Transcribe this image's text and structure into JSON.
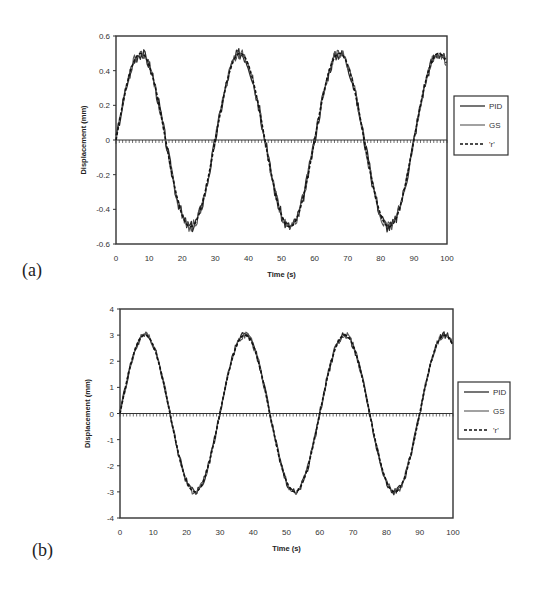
{
  "chart_data": [
    {
      "panel_label": "(a)",
      "type": "line",
      "title": "",
      "xlabel": "Time (s)",
      "ylabel": "Displacement (mm)",
      "xlim": [
        0,
        100
      ],
      "ylim": [
        -0.6,
        0.6
      ],
      "xticks": [
        0,
        10,
        20,
        30,
        40,
        50,
        60,
        70,
        80,
        90,
        100
      ],
      "yticks": [
        0.6,
        0.4,
        0.2,
        0,
        -0.2,
        -0.4,
        -0.6
      ],
      "ytick_labels": [
        "0.6",
        "0.4",
        "0.2",
        "0",
        "-0.2",
        "-0.4",
        "-0.6"
      ],
      "grid": false,
      "legend_position": "right",
      "signal": {
        "form": "sine",
        "amplitude": 0.5,
        "period_s": 30,
        "offset": 0
      },
      "series": [
        {
          "name": "PID",
          "style": "solid",
          "noise": 0.035,
          "x": [
            0,
            7.5,
            15,
            22.5,
            30,
            37.5,
            45,
            52.5,
            60,
            67.5,
            75,
            82.5,
            90,
            97.5,
            100
          ],
          "values": [
            0,
            0.52,
            0,
            -0.5,
            0,
            0.53,
            0,
            -0.52,
            0,
            0.52,
            0,
            -0.52,
            0,
            0.53,
            0.44
          ]
        },
        {
          "name": "GS",
          "style": "solid",
          "noise": 0.03,
          "x": [
            0,
            7.5,
            15,
            22.5,
            30,
            37.5,
            45,
            52.5,
            60,
            67.5,
            75,
            82.5,
            90,
            97.5,
            100
          ],
          "values": [
            0,
            0.5,
            0,
            -0.5,
            0,
            0.5,
            0,
            -0.5,
            0,
            0.5,
            0,
            -0.5,
            0,
            0.5,
            0.43
          ]
        },
        {
          "name": "'r'",
          "style": "dashed",
          "noise": 0,
          "x": [
            0,
            7.5,
            15,
            22.5,
            30,
            37.5,
            45,
            52.5,
            60,
            67.5,
            75,
            82.5,
            90,
            97.5,
            100
          ],
          "values": [
            0,
            0.5,
            0,
            -0.5,
            0,
            0.5,
            0,
            -0.5,
            0,
            0.5,
            0,
            -0.5,
            0,
            0.5,
            0.43
          ]
        }
      ]
    },
    {
      "panel_label": "(b)",
      "type": "line",
      "title": "",
      "xlabel": "Time (s)",
      "ylabel": "Displacement (mm)",
      "xlim": [
        0,
        100
      ],
      "ylim": [
        -4,
        4
      ],
      "xticks": [
        0,
        10,
        20,
        30,
        40,
        50,
        60,
        70,
        80,
        90,
        100
      ],
      "yticks": [
        4,
        3,
        2,
        1,
        0,
        -1,
        -2,
        -3,
        -4
      ],
      "ytick_labels": [
        "4",
        "3",
        "2",
        "1",
        "0",
        "-1",
        "-2",
        "-3",
        "-4"
      ],
      "grid": false,
      "legend_position": "right",
      "signal": {
        "form": "sine",
        "amplitude": 3,
        "period_s": 30,
        "offset": 0
      },
      "series": [
        {
          "name": "PID",
          "style": "solid",
          "noise": 0.02,
          "x": [
            0,
            7.5,
            15,
            22.5,
            30,
            37.5,
            45,
            52.5,
            60,
            67.5,
            75,
            82.5,
            90,
            97.5,
            100
          ],
          "values": [
            0,
            3,
            0,
            -3,
            0,
            3,
            0,
            -3,
            0,
            3,
            0,
            -3,
            0,
            3,
            2.6
          ]
        },
        {
          "name": "GS",
          "style": "solid",
          "noise": 0.02,
          "x": [
            0,
            7.5,
            15,
            22.5,
            30,
            37.5,
            45,
            52.5,
            60,
            67.5,
            75,
            82.5,
            90,
            97.5,
            100
          ],
          "values": [
            0,
            3,
            0,
            -3,
            0,
            3,
            0,
            -3,
            0,
            3,
            0,
            -3,
            0,
            3,
            2.6
          ]
        },
        {
          "name": "'r'",
          "style": "dashed",
          "noise": 0,
          "x": [
            0,
            7.5,
            15,
            22.5,
            30,
            37.5,
            45,
            52.5,
            60,
            67.5,
            75,
            82.5,
            90,
            97.5,
            100
          ],
          "values": [
            0,
            3,
            0,
            -3,
            0,
            3,
            0,
            -3,
            0,
            3,
            0,
            -3,
            0,
            3,
            2.6
          ]
        }
      ]
    }
  ],
  "colors": {
    "line_pid": "#2a2a2a",
    "line_gs": "#555555",
    "line_r": "#111111",
    "frame": "#333333"
  }
}
